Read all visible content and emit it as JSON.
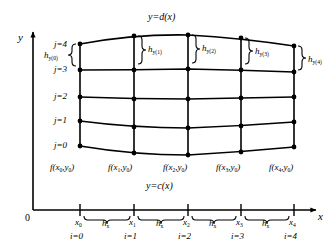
{
  "figure": {
    "type": "curvilinear-integration-grid",
    "axes": {
      "x_label": "x",
      "y_label": "y",
      "origin_label": "0"
    },
    "boundary_curves": {
      "upper_label": "y=d(x)",
      "lower_label": "y=c(x)"
    },
    "x_nodes": [
      {
        "tick": "x",
        "tick_sub": "0",
        "index": "i=0"
      },
      {
        "tick": "x",
        "tick_sub": "1",
        "index": "i=1"
      },
      {
        "tick": "x",
        "tick_sub": "2",
        "index": "i=2"
      },
      {
        "tick": "x",
        "tick_sub": "3",
        "index": "i=3"
      },
      {
        "tick": "x",
        "tick_sub": "4",
        "index": "i=4"
      }
    ],
    "x_spacings": [
      {
        "label": "h",
        "label_sub": "x"
      },
      {
        "label": "h",
        "label_sub": "x"
      },
      {
        "label": "h",
        "label_sub": "x"
      },
      {
        "label": "h",
        "label_sub": "x"
      }
    ],
    "j_labels": [
      "j=0",
      "j=1",
      "j=2",
      "j=3",
      "j=4"
    ],
    "y_spacings": [
      {
        "label": "h",
        "label_sub": "y(0)"
      },
      {
        "label": "h",
        "label_sub": "y(1)"
      },
      {
        "label": "h",
        "label_sub": "y(2)"
      },
      {
        "label": "h",
        "label_sub": "y(3)"
      },
      {
        "label": "h",
        "label_sub": "y(4)"
      }
    ],
    "base_point_labels": [
      {
        "fn": "f",
        "arg_x": "x",
        "arg_x_sub": "0",
        "arg_y": "y",
        "arg_y_sub": "0"
      },
      {
        "fn": "f",
        "arg_x": "x",
        "arg_x_sub": "1",
        "arg_y": "y",
        "arg_y_sub": "0"
      },
      {
        "fn": "f",
        "arg_x": "x",
        "arg_x_sub": "2",
        "arg_y": "y",
        "arg_y_sub": "0"
      },
      {
        "fn": "f",
        "arg_x": "x",
        "arg_x_sub": "3",
        "arg_y": "y",
        "arg_y_sub": "0"
      },
      {
        "fn": "f",
        "arg_x": "x",
        "arg_x_sub": "4",
        "arg_y": "y",
        "arg_y_sub": "0"
      }
    ],
    "colors": {
      "ink": "#000000",
      "background": "#ffffff"
    }
  }
}
